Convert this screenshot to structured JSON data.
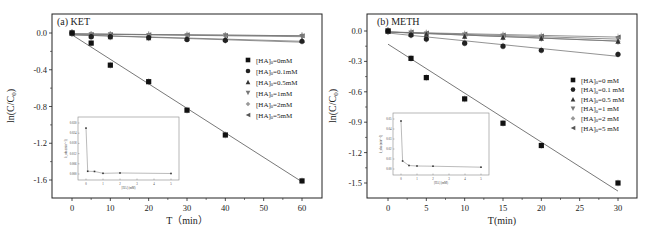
{
  "chart_data": [
    {
      "type": "scatter",
      "panel_label": "(a) KET",
      "title": "(a) KET",
      "xlabel": "T（min）",
      "ylabel": "ln(C/C0)",
      "xlim": [
        -5,
        65
      ],
      "ylim": [
        -1.8,
        0.2
      ],
      "x_ticks": [
        0,
        10,
        20,
        30,
        40,
        50,
        60
      ],
      "y_ticks": [
        0.0,
        -0.4,
        -0.8,
        -1.2,
        -1.6
      ],
      "y_tick_labels": [
        "0.0",
        "-0.4",
        "-0.8",
        "-1.2",
        "-1.6"
      ],
      "grid": false,
      "legend_position": "right-middle",
      "x": [
        0,
        5,
        10,
        20,
        30,
        40,
        60
      ],
      "series": [
        {
          "name": "[HA]0=0mM",
          "marker": "square",
          "color": "#111111",
          "values": [
            0.0,
            -0.11,
            -0.35,
            -0.53,
            -0.84,
            -1.11,
            -1.61
          ],
          "fit": [
            -0.02,
            -1.62
          ]
        },
        {
          "name": "[HA]0=0.1mM",
          "marker": "circle",
          "color": "#222222",
          "values": [
            0.0,
            -0.04,
            -0.04,
            -0.05,
            -0.07,
            -0.08,
            -0.09
          ],
          "fit": [
            -0.02,
            -0.1
          ]
        },
        {
          "name": "[HA]0=0.5mM",
          "marker": "triangle-up",
          "color": "#333333",
          "values": [
            0.0,
            -0.03,
            -0.04,
            -0.05,
            -0.06,
            -0.07,
            -0.08
          ],
          "fit": [
            -0.02,
            -0.09
          ]
        },
        {
          "name": "[HA]0=1mM",
          "marker": "triangle-down",
          "color": "#777777",
          "values": [
            0.0,
            -0.02,
            -0.02,
            -0.03,
            -0.03,
            -0.03,
            -0.04
          ],
          "fit": [
            -0.01,
            -0.04
          ]
        },
        {
          "name": "[HA]0=2mM",
          "marker": "diamond",
          "color": "#999999",
          "values": [
            0.0,
            -0.02,
            -0.02,
            -0.02,
            -0.03,
            -0.03,
            -0.03
          ],
          "fit": [
            -0.01,
            -0.03
          ]
        },
        {
          "name": "[HA]0=5mM",
          "marker": "triangle-left",
          "color": "#555555",
          "values": [
            0.0,
            -0.02,
            -0.02,
            -0.02,
            -0.02,
            -0.03,
            -0.03
          ],
          "fit": [
            -0.01,
            -0.03
          ]
        }
      ],
      "inset": {
        "type": "line",
        "xlabel": "[HA] (mM)",
        "ylabel": "k_obs (min^-1)",
        "x_ticks": [
          0,
          1,
          2,
          3,
          4,
          5
        ],
        "y_ticks": [
          "0.000",
          "0.006",
          "0.012",
          "0.018",
          "0.024",
          "0.030"
        ],
        "x": [
          0,
          0.1,
          0.5,
          1,
          2,
          5
        ],
        "values": [
          0.027,
          0.0016,
          0.0015,
          0.0004,
          0.0006,
          0.0003
        ]
      }
    },
    {
      "type": "scatter",
      "panel_label": "(b) METH",
      "title": "(b) METH",
      "xlabel": "T(min)",
      "ylabel": "ln(C/C0)",
      "xlim": [
        -2.5,
        33
      ],
      "ylim": [
        -1.7,
        0.15
      ],
      "x_ticks": [
        0,
        5,
        10,
        15,
        20,
        25,
        30
      ],
      "y_ticks": [
        0.0,
        -0.3,
        -0.6,
        -0.9,
        -1.2,
        -1.5
      ],
      "y_tick_labels": [
        "0.0",
        "-0.3",
        "-0.6",
        "-0.9",
        "-1.2",
        "-1.5"
      ],
      "grid": false,
      "legend_position": "right-middle",
      "x": [
        0,
        3,
        5,
        10,
        15,
        20,
        30
      ],
      "series": [
        {
          "name": "[HA]0=0 mM",
          "marker": "square",
          "color": "#111111",
          "values": [
            0.0,
            -0.27,
            -0.46,
            -0.67,
            -0.91,
            -1.13,
            -1.5
          ],
          "fit": [
            -0.13,
            -1.58
          ]
        },
        {
          "name": "[HA]0=0.1 mM",
          "marker": "circle",
          "color": "#222222",
          "values": [
            0.0,
            -0.04,
            -0.08,
            -0.12,
            -0.15,
            -0.19,
            -0.23
          ],
          "fit": [
            -0.02,
            -0.25
          ]
        },
        {
          "name": "[HA]0=0.5 mM",
          "marker": "triangle-up",
          "color": "#333333",
          "values": [
            0.0,
            -0.03,
            -0.03,
            -0.05,
            -0.06,
            -0.07,
            -0.1
          ],
          "fit": [
            -0.01,
            -0.1
          ]
        },
        {
          "name": "[HA]0=1 mM",
          "marker": "triangle-down",
          "color": "#777777",
          "values": [
            0.0,
            -0.02,
            -0.03,
            -0.04,
            -0.05,
            -0.06,
            -0.08
          ],
          "fit": [
            -0.01,
            -0.08
          ]
        },
        {
          "name": "[HA]0=2 mM",
          "marker": "diamond",
          "color": "#999999",
          "values": [
            0.0,
            -0.02,
            -0.03,
            -0.04,
            -0.05,
            -0.07,
            -0.1
          ],
          "fit": [
            -0.01,
            -0.1
          ]
        },
        {
          "name": "[HA]0=5 mM",
          "marker": "triangle-left",
          "color": "#555555",
          "values": [
            0.0,
            -0.01,
            -0.02,
            -0.03,
            -0.04,
            -0.05,
            -0.06
          ],
          "fit": [
            -0.01,
            -0.06
          ]
        }
      ],
      "inset": {
        "type": "line",
        "xlabel": "[HA] (mM)",
        "ylabel": "k_obs (min^-1)",
        "x_ticks": [
          0,
          1,
          2,
          3,
          4,
          5
        ],
        "y_ticks": [
          "0.00",
          "0.01",
          "0.02",
          "0.03",
          "0.04",
          "0.05"
        ],
        "x": [
          0,
          0.1,
          0.5,
          1,
          2,
          5
        ],
        "values": [
          0.048,
          0.008,
          0.0035,
          0.003,
          0.0028,
          0.0018
        ]
      }
    }
  ]
}
